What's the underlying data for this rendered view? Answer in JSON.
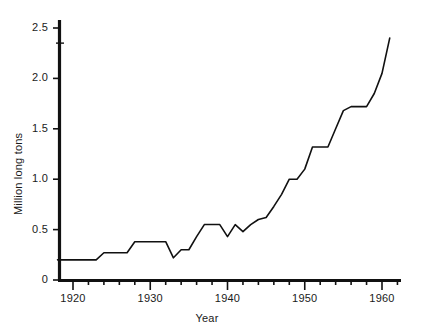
{
  "chart_data": {
    "type": "line",
    "title": "",
    "subtitle": "",
    "xlabel": "Year",
    "ylabel": "Million long tons",
    "xlim": [
      1918,
      1962
    ],
    "ylim": [
      0,
      2.6
    ],
    "grid": false,
    "legend": null,
    "x_ticks_major": [
      1920,
      1930,
      1940,
      1950,
      1960
    ],
    "x_tick_labels": [
      "1920",
      "1930",
      "1940",
      "1950",
      "1960"
    ],
    "x_tick_minor_step": 2,
    "y_ticks": [
      0,
      0.5,
      1.0,
      1.5,
      2.0,
      2.5
    ],
    "y_tick_labels": [
      "0",
      "0.5",
      "1.0",
      "1.5",
      "2.0",
      "2.5"
    ],
    "line_color": "#111111",
    "line_width": 1.6,
    "series": [
      {
        "name": "Production",
        "x": [
          1918,
          1919,
          1920,
          1921,
          1922,
          1923,
          1924,
          1925,
          1926,
          1927,
          1928,
          1929,
          1930,
          1931,
          1932,
          1933,
          1934,
          1935,
          1936,
          1937,
          1938,
          1939,
          1940,
          1941,
          1942,
          1943,
          1944,
          1945,
          1946,
          1947,
          1948,
          1949,
          1950,
          1951,
          1952,
          1953,
          1954,
          1955,
          1956,
          1957,
          1958,
          1959,
          1960,
          1961
        ],
        "values": [
          0.2,
          0.2,
          0.2,
          0.2,
          0.2,
          0.2,
          0.27,
          0.27,
          0.27,
          0.27,
          0.38,
          0.38,
          0.38,
          0.38,
          0.38,
          0.22,
          0.3,
          0.3,
          0.43,
          0.55,
          0.55,
          0.55,
          0.43,
          0.55,
          0.48,
          0.55,
          0.6,
          0.62,
          0.73,
          0.85,
          1.0,
          1.0,
          1.1,
          1.32,
          1.32,
          1.32,
          1.5,
          1.68,
          1.72,
          1.72,
          1.72,
          1.85,
          2.05,
          2.4
        ]
      }
    ]
  },
  "axis": {
    "x_axis_name": "x-axis",
    "y_axis_name": "y-axis"
  }
}
